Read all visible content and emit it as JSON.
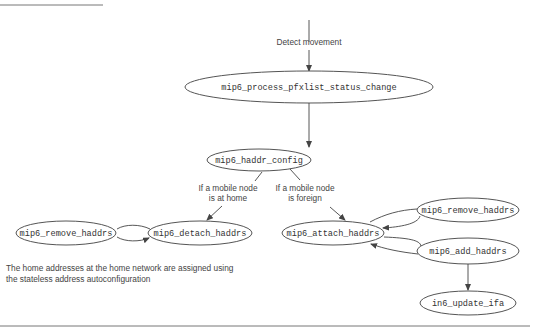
{
  "diagram": {
    "type": "call-flow",
    "entry_label": "Detect movement",
    "nodes": {
      "process": "mip6_process_pfxlist_status_change",
      "config": "mip6_haddr_config",
      "remove_left": "mip6_remove_haddrs",
      "detach": "mip6_detach_haddrs",
      "attach": "mip6_attach_haddrs",
      "remove_right": "mip6_remove_haddrs",
      "add": "mip6_add_haddrs",
      "update": "in6_update_ifa"
    },
    "edge_labels": {
      "home_line1": "If a mobile node",
      "home_line2": "is at home",
      "foreign_line1": "If a mobile node",
      "foreign_line2": "is foreign"
    },
    "note": {
      "line1": "The home addresses at the home network are assigned using",
      "line2": "the stateless address autoconfiguration"
    },
    "edges": [
      [
        "entry",
        "process"
      ],
      [
        "process",
        "config"
      ],
      [
        "config",
        "detach"
      ],
      [
        "config",
        "attach"
      ],
      [
        "detach",
        "remove_left"
      ],
      [
        "remove_left",
        "detach"
      ],
      [
        "attach",
        "remove_right"
      ],
      [
        "remove_right",
        "attach"
      ],
      [
        "attach",
        "add"
      ],
      [
        "add",
        "attach"
      ],
      [
        "add",
        "update"
      ]
    ]
  }
}
